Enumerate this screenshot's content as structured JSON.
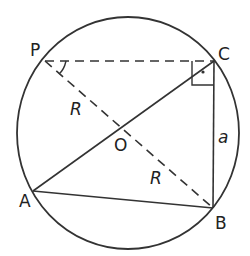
{
  "diagram": {
    "type": "inscribed-right-triangle-circle",
    "colors": {
      "stroke": "#333333",
      "background": "#ffffff"
    },
    "circle": {
      "cx": 128,
      "cy": 133,
      "rx": 111,
      "ry": 116
    },
    "points": {
      "P": {
        "label": "P",
        "x": 45,
        "y": 61
      },
      "C": {
        "label": "C",
        "x": 214,
        "y": 61
      },
      "O": {
        "label": "O",
        "x": 122,
        "y": 128
      },
      "A": {
        "label": "A",
        "x": 33,
        "y": 191
      },
      "B": {
        "label": "B",
        "x": 213,
        "y": 208
      }
    },
    "segments": [
      {
        "from": "P",
        "to": "C",
        "style": "dashed"
      },
      {
        "from": "P",
        "to": "B",
        "style": "dashed"
      },
      {
        "from": "A",
        "to": "C",
        "style": "solid"
      },
      {
        "from": "A",
        "to": "B",
        "style": "solid"
      },
      {
        "from": "C",
        "to": "B",
        "style": "solid"
      }
    ],
    "labels": {
      "P": "P",
      "C": "C",
      "O": "O",
      "A": "A",
      "B": "B",
      "radius_upper": "R",
      "radius_lower": "R",
      "side": "a"
    },
    "markers": {
      "right_angle_at": "C",
      "angle_arc_at": "P"
    }
  }
}
